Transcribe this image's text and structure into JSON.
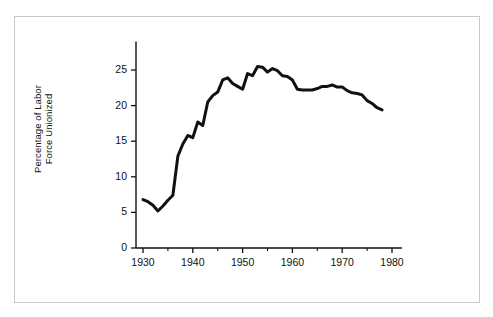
{
  "figure": {
    "background_color": "#ffffff",
    "frame_color": "#c9c9c9",
    "line_color": "#111111"
  },
  "axis": {
    "y_label_line1": "Percentage of Labor",
    "y_label_line2": "Force Unionized",
    "y_label": "Percentage of Labor\nForce Unionized",
    "x_label": ""
  },
  "chart_data": {
    "type": "line",
    "title": "",
    "xlabel": "",
    "ylabel": "Percentage of Labor Force Unionized",
    "xlim": [
      1929,
      1982
    ],
    "ylim": [
      0,
      29
    ],
    "xticks": [
      1930,
      1940,
      1950,
      1960,
      1970,
      1980
    ],
    "xtick_labels": [
      "1930",
      "1940",
      "1950",
      "1960",
      "1970",
      "1980"
    ],
    "x_minor_ticks": [
      1935,
      1945,
      1955,
      1965,
      1975
    ],
    "yticks": [
      0,
      5,
      10,
      15,
      20,
      25
    ],
    "ytick_labels": [
      "0",
      "5",
      "10",
      "15",
      "20",
      "25"
    ],
    "grid": false,
    "legend": false,
    "line_width": 3,
    "series": [
      {
        "name": "Percentage of Labor Force Unionized",
        "color": "#111111",
        "x": [
          1930,
          1931,
          1932,
          1933,
          1934,
          1935,
          1936,
          1937,
          1938,
          1939,
          1940,
          1941,
          1942,
          1943,
          1944,
          1945,
          1946,
          1947,
          1948,
          1949,
          1950,
          1951,
          1952,
          1953,
          1954,
          1955,
          1956,
          1957,
          1958,
          1959,
          1960,
          1961,
          1962,
          1963,
          1964,
          1965,
          1966,
          1967,
          1968,
          1969,
          1970,
          1971,
          1972,
          1973,
          1974,
          1975,
          1976,
          1977,
          1978
        ],
        "y": [
          6.8,
          6.5,
          6.0,
          5.2,
          5.9,
          6.7,
          7.4,
          12.9,
          14.6,
          15.8,
          15.5,
          17.7,
          17.2,
          20.5,
          21.4,
          21.9,
          23.6,
          23.9,
          23.1,
          22.7,
          22.3,
          24.5,
          24.2,
          25.5,
          25.4,
          24.7,
          25.2,
          24.9,
          24.2,
          24.1,
          23.6,
          22.3,
          22.2,
          22.2,
          22.2,
          22.4,
          22.7,
          22.7,
          22.9,
          22.6,
          22.6,
          22.1,
          21.8,
          21.7,
          21.5,
          20.7,
          20.3,
          19.7,
          19.4
        ]
      }
    ]
  }
}
